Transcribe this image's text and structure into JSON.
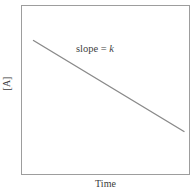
{
  "chart_data": {
    "type": "line",
    "title": "",
    "xlabel": "Time",
    "ylabel": "[A]",
    "grid": false,
    "legend": null,
    "xlim": [
      0,
      1
    ],
    "ylim": [
      0,
      1
    ],
    "axis_ticks": {
      "x": [],
      "y": []
    },
    "series": [
      {
        "name": "[A] vs Time",
        "color": "#8a8a8a",
        "x": [
          0.075,
          0.965
        ],
        "y": [
          0.795,
          0.259
        ],
        "points_px": [
          {
            "x": 33.5,
            "y": 40.5
          },
          {
            "x": 184.0,
            "y": 131.5
          }
        ]
      }
    ],
    "annotations": [
      {
        "name": "slope-annotation",
        "text_prefix": "slope = ",
        "symbol": "k",
        "full_text": "slope = k",
        "x_px": 76,
        "y_px": 43
      }
    ],
    "frame": {
      "color": "#9d9d9d",
      "left_px": 21,
      "top_px": 5,
      "width_px": 169,
      "height_px": 170
    },
    "background": "#ffffff"
  },
  "labels": {
    "y_axis": "[A]",
    "x_axis": "Time",
    "annotation_prefix": "slope = ",
    "annotation_symbol": "k"
  },
  "colors": {
    "background": "#ffffff",
    "frame": "#9d9d9d",
    "line": "#8a8a8a",
    "text": "#3a3a3a"
  }
}
